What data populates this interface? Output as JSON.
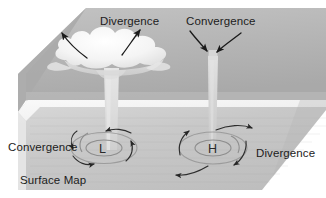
{
  "figure": {
    "surface_label": "Surface Map"
  },
  "labels": {
    "upper_left": "Divergence",
    "upper_right": "Convergence",
    "lower_left": "Convergence",
    "lower_right": "Divergence",
    "surface_map": "Surface Map",
    "low_center": "L",
    "high_center": "H"
  },
  "colors": {
    "page_background": "#ffffff",
    "top_plane": "#b9b9b9",
    "top_plane_shadow": "#a6a6a6",
    "ground_plane": "#c3c3c3",
    "ground_plane_light": "#d2d2d2",
    "front_edge": "#f2f2f2",
    "cloud": "#f0f0f0",
    "column": "#d9d9d9",
    "arrow_stroke": "#1a1a1a",
    "ring_stroke": "#8d8d8d",
    "text": "#1c1c1c"
  },
  "elements": {
    "cloud": "cumulus-cloud",
    "updraft_column": "rising-air-column",
    "downdraft_column": "sinking-air-column",
    "low_ring": "low-pressure-circulation",
    "high_ring": "high-pressure-circulation"
  }
}
